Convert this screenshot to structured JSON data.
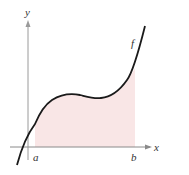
{
  "figure": {
    "labels": {
      "y_axis": "y",
      "x_axis": "x",
      "function": "f",
      "lower_bound": "a",
      "upper_bound": "b"
    },
    "colors": {
      "curve": "#1a1a1a",
      "axes": "#8a8a8a",
      "shaded_region": "#f9e6e6",
      "text": "#333333"
    }
  }
}
